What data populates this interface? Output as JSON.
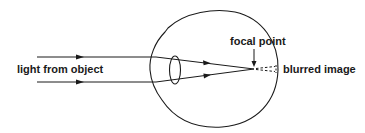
{
  "diagram": {
    "labels": {
      "light_source": "light from object",
      "focal_point": "focal point",
      "blurred_image": "blurred image"
    },
    "colors": {
      "stroke": "#1a1a1a",
      "background": "#ffffff"
    }
  }
}
